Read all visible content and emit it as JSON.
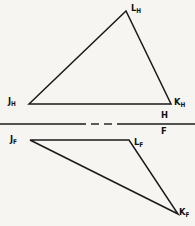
{
  "figure": {
    "background_color": "#f7f5f1",
    "line_color": "#1a1a1a",
    "width": 195,
    "height": 226
  },
  "labels": {
    "L_H": {
      "base": "L",
      "sub": "H",
      "x": 131,
      "y": 3
    },
    "J_H": {
      "base": "J",
      "sub": "H",
      "x": 8,
      "y": 96
    },
    "K_H": {
      "base": "K",
      "sub": "H",
      "x": 174,
      "y": 97
    },
    "H": {
      "base": "H",
      "sub": "",
      "x": 161,
      "y": 110
    },
    "F": {
      "base": "F",
      "sub": "",
      "x": 161,
      "y": 126
    },
    "J_F": {
      "base": "J",
      "sub": "F",
      "x": 10,
      "y": 134
    },
    "L_F": {
      "base": "L",
      "sub": "F",
      "x": 134,
      "y": 137
    },
    "K_F": {
      "base": "K",
      "sub": "F",
      "x": 179,
      "y": 207
    }
  },
  "views": {
    "horizontal_view": {
      "name": "top-view-triangle",
      "vertices": [
        {
          "id": "J_H",
          "x": 29,
          "y": 104
        },
        {
          "id": "L_H",
          "x": 126,
          "y": 11
        },
        {
          "id": "K_H",
          "x": 171,
          "y": 104
        }
      ]
    },
    "frontal_view": {
      "name": "front-view-triangle",
      "vertices": [
        {
          "id": "J_F",
          "x": 30,
          "y": 140
        },
        {
          "id": "L_F",
          "x": 129,
          "y": 140
        },
        {
          "id": "K_F",
          "x": 178,
          "y": 214
        }
      ]
    }
  },
  "reference_line": {
    "name": "hf-fold-line",
    "y": 124,
    "segments": [
      {
        "x1": 0,
        "x2": 86
      },
      {
        "x1": 91,
        "x2": 99
      },
      {
        "x1": 104,
        "x2": 112
      },
      {
        "x1": 117,
        "x2": 195
      }
    ]
  }
}
